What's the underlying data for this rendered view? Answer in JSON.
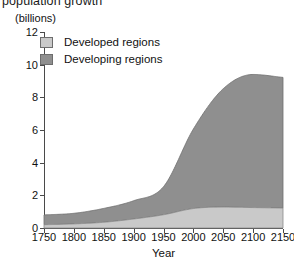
{
  "figure": {
    "title_clipped": "population growth",
    "y_unit_label": "(billions)",
    "x_axis_title": "Year"
  },
  "legend": {
    "position": "top-left-inside",
    "items": [
      {
        "label": "Developed regions",
        "color": "#c9c9c9"
      },
      {
        "label": "Developing regions",
        "color": "#8f8f8f"
      }
    ]
  },
  "axes": {
    "y_ticks": [
      "0",
      "2",
      "4",
      "6",
      "8",
      "10",
      "12"
    ],
    "x_ticks": [
      "1750",
      "1800",
      "1850",
      "1900",
      "1950",
      "2000",
      "2050",
      "2100",
      "2150"
    ]
  },
  "chart_data": {
    "type": "area",
    "stacked": true,
    "title": "population growth",
    "xlabel": "Year",
    "ylabel": "(billions)",
    "xlim": [
      1750,
      2150
    ],
    "ylim": [
      0,
      12
    ],
    "yticks": [
      0,
      2,
      4,
      6,
      8,
      10,
      12
    ],
    "xticks": [
      1750,
      1800,
      1850,
      1900,
      1950,
      2000,
      2050,
      2100,
      2150
    ],
    "grid": false,
    "legend_position": "upper left",
    "x": [
      1750,
      1800,
      1850,
      1900,
      1950,
      2000,
      2050,
      2100,
      2150
    ],
    "series": [
      {
        "name": "Developed regions",
        "color": "#c9c9c9",
        "values": [
          0.2,
          0.25,
          0.35,
          0.55,
          0.81,
          1.19,
          1.28,
          1.25,
          1.22
        ]
      },
      {
        "name": "Developing regions",
        "color": "#8f8f8f",
        "values": [
          0.6,
          0.65,
          0.85,
          1.12,
          1.72,
          4.87,
          7.25,
          8.15,
          8.0
        ]
      }
    ],
    "totals": [
      0.8,
      0.9,
      1.2,
      1.67,
      2.53,
      6.06,
      8.53,
      9.4,
      9.22
    ],
    "annotations": []
  }
}
